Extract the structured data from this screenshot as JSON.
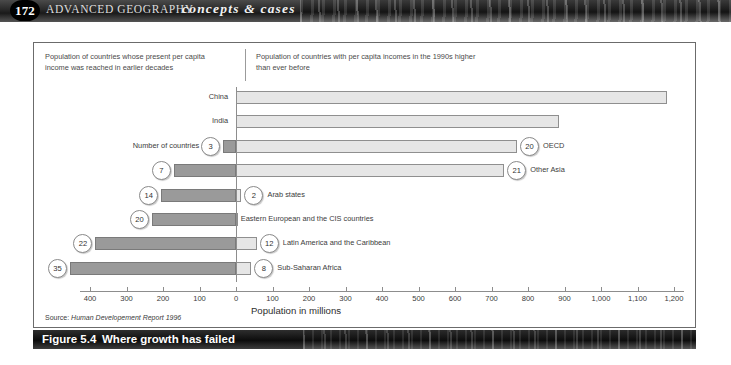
{
  "header": {
    "page_number": "172",
    "title": "ADVANCED GEOGRAPHY",
    "subtitle": "concepts & cases"
  },
  "figure": {
    "caption_number": "Figure 5.4",
    "caption_text": "Where growth has failed",
    "source_prefix": "Source:",
    "source_text": "Human Developement Report 1996"
  },
  "legend": {
    "left": "Population of countries whose present per capita income was reached in earlier decades",
    "right": "Population of countries with per capita incomes  in the 1990s higher than ever before"
  },
  "axis": {
    "title": "Population in millions",
    "tick_labels": [
      "400",
      "300",
      "200",
      "100",
      "0",
      "100",
      "200",
      "300",
      "400",
      "500",
      "600",
      "700",
      "800",
      "900",
      "1,000",
      "1,100",
      "1,200"
    ]
  },
  "series_label": "Number of countries",
  "chart_data": {
    "type": "bar",
    "title": "Where growth has failed",
    "subtitle": "Figure 5.4",
    "xlabel": "Population in millions",
    "ylabel": "",
    "orientation": "horizontal",
    "layout": "diverging-bidirectional",
    "xlim": [
      -500,
      1200
    ],
    "grid": false,
    "legend_position": "top",
    "left_axis_label": "Population of countries whose present per capita income was reached in earlier decades",
    "right_axis_label": "Population of countries with per capita incomes  in the 1990s higher than ever before",
    "categories": [
      "China",
      "India",
      "OECD",
      "Other Asia",
      "Arab states",
      "Eastern European and the CIS countries",
      "Latin America and the Caribbean",
      "Sub-Saharan Africa"
    ],
    "series": [
      {
        "name": "Population of countries whose present per capita income was reached in earlier decades",
        "direction": "left",
        "values": [
          0,
          0,
          35,
          170,
          205,
          230,
          385,
          455
        ]
      },
      {
        "name": "Population of countries with per capita incomes in the 1990s higher than ever before",
        "direction": "right",
        "values": [
          1180,
          885,
          770,
          735,
          15,
          5,
          57,
          42
        ]
      }
    ],
    "annotations": {
      "name": "Number of countries",
      "left_counts": [
        null,
        null,
        3,
        7,
        14,
        20,
        22,
        35
      ],
      "right_counts": [
        null,
        null,
        20,
        21,
        2,
        null,
        12,
        8
      ]
    },
    "rows": [
      {
        "category": "China",
        "label_side": "left",
        "left_value": 0,
        "right_value": 1180,
        "left_count": null,
        "right_count": null
      },
      {
        "category": "India",
        "label_side": "left",
        "left_value": 0,
        "right_value": 885,
        "left_count": null,
        "right_count": null
      },
      {
        "category": "OECD",
        "label_side": "right",
        "left_value": 35,
        "right_value": 770,
        "left_count": 3,
        "right_count": 20
      },
      {
        "category": "Other Asia",
        "label_side": "right",
        "left_value": 170,
        "right_value": 735,
        "left_count": 7,
        "right_count": 21
      },
      {
        "category": "Arab states",
        "label_side": "right",
        "left_value": 205,
        "right_value": 15,
        "left_count": 14,
        "right_count": 2
      },
      {
        "category": "Eastern European and the CIS countries",
        "label_side": "right",
        "left_value": 230,
        "right_value": 5,
        "left_count": 20,
        "right_count": null
      },
      {
        "category": "Latin America and the Caribbean",
        "label_side": "right",
        "left_value": 385,
        "right_value": 57,
        "left_count": 22,
        "right_count": 12
      },
      {
        "category": "Sub-Saharan Africa",
        "label_side": "right",
        "left_value": 455,
        "right_value": 42,
        "left_count": 35,
        "right_count": 8
      }
    ]
  },
  "colors": {
    "left_bar_fill": "#9a9a9a",
    "right_bar_fill": "#e6e6e6",
    "bar_stroke": "#7a7a7a",
    "axis": "#8d8d8d",
    "header_bar": "#1a1a1a",
    "caption_bar": "#0c0c0c",
    "text": "#3b3b3b"
  }
}
